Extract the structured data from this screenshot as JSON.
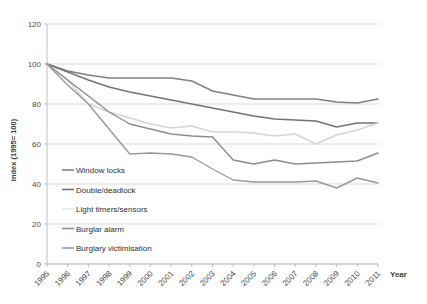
{
  "chart_data": {
    "type": "line",
    "title": "",
    "xlabel": "Year",
    "ylabel": "Index (1995= 100)",
    "ylim": [
      0,
      120
    ],
    "yticks": [
      0,
      20,
      40,
      60,
      80,
      100,
      120
    ],
    "grid": true,
    "legend_position": "inside-left",
    "categories": [
      "1995",
      "1996",
      "1997",
      "1998",
      "1999",
      "2000",
      "2001",
      "2002",
      "2003",
      "2004",
      "2005",
      "2006",
      "2007",
      "2008",
      "2009",
      "2010",
      "2011"
    ],
    "x": [
      1995,
      1996,
      1997,
      1998,
      1999,
      2000,
      2001,
      2002,
      2003,
      2004,
      2005,
      2006,
      2007,
      2008,
      2009,
      2010,
      2011
    ],
    "series": [
      {
        "name": "Window locks",
        "color": "#808080",
        "values": [
          100,
          96.5,
          94.5,
          93,
          93,
          93,
          93,
          91.5,
          86.5,
          84.5,
          82.5,
          82.5,
          82.5,
          82.5,
          81,
          80.5,
          82.5
        ]
      },
      {
        "name": "Double/deadlock",
        "color": "#737373",
        "values": [
          100,
          96,
          92,
          88.5,
          86,
          84,
          82,
          80,
          78,
          76,
          74,
          72.5,
          72,
          71.5,
          68.5,
          70.5,
          70.5
        ]
      },
      {
        "name": "Light timers/sensors",
        "color": "#d4d4d4",
        "values": [
          100,
          92,
          80,
          76,
          73,
          70,
          68,
          69,
          66,
          66,
          65.5,
          64,
          65,
          60,
          64.5,
          67,
          70.5
        ]
      },
      {
        "name": "Burglar alarm",
        "color": "#8c8c8c",
        "values": [
          100,
          92,
          84,
          76,
          70,
          67.5,
          65,
          64,
          63.5,
          52,
          50,
          52,
          50,
          50.5,
          51,
          51.5,
          55.5
        ]
      },
      {
        "name": "Burglary victimisation",
        "color": "#999999",
        "values": [
          100,
          89.5,
          80,
          67.5,
          55,
          55.5,
          55,
          53.5,
          47.5,
          42,
          41,
          41,
          41,
          41.5,
          38,
          43,
          40.5
        ]
      }
    ]
  },
  "legend": {
    "items": [
      {
        "label": "Window locks",
        "swatch": "#808080",
        "has_swatch": true
      },
      {
        "label": "Double/deadlock",
        "swatch": "#737373",
        "has_swatch": true
      },
      {
        "label": "Light timers/sensors",
        "swatch": "#e8e8e8",
        "has_swatch": true
      },
      {
        "label": "Burglar alarm",
        "swatch": "#8c8c8c",
        "has_swatch": true
      },
      {
        "label": "Burglary victimisation",
        "swatch": "#999999",
        "has_swatch": true
      }
    ]
  },
  "axes": {
    "y_title": "Index (1995= 100)",
    "x_title": "Year",
    "y_tick_labels": [
      "120",
      "100",
      "80",
      "60",
      "40",
      "20",
      "0"
    ],
    "x_tick_labels": [
      "1995",
      "1996",
      "1997",
      "1998",
      "1999",
      "2000",
      "2001",
      "2002",
      "2003",
      "2004",
      "2005",
      "2006",
      "2007",
      "2008",
      "2009",
      "2010",
      "2011"
    ]
  },
  "colors": {
    "grid": "#d9d9d9",
    "axis": "#bfbfbf",
    "text": "#4a4a4a",
    "background": "#ffffff"
  }
}
